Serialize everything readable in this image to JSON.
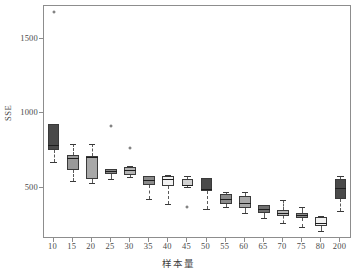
{
  "chart_data": {
    "type": "box",
    "title": "",
    "subtitle": "",
    "xlabel": "样本量",
    "ylabel": "SSE",
    "grid": false,
    "legend": "none",
    "ylim": [
      170,
      1720
    ],
    "y_ticks": [
      500,
      1000,
      1500
    ],
    "y_tick_labels": [
      "500",
      "1000",
      "1500"
    ],
    "categories": [
      "10",
      "15",
      "20",
      "25",
      "30",
      "35",
      "40",
      "45",
      "50",
      "55",
      "60",
      "65",
      "70",
      "75",
      "80",
      "200"
    ],
    "boxes": [
      {
        "category": "10",
        "min": 670,
        "q1": 752,
        "median": 790,
        "q3": 925,
        "max": 925,
        "fill": "#4a4a4a",
        "outliers": [
          1680
        ]
      },
      {
        "category": "15",
        "min": 548,
        "q1": 620,
        "median": 700,
        "q3": 720,
        "max": 795,
        "fill": "#9a9a9a",
        "outliers": []
      },
      {
        "category": "20",
        "min": 535,
        "q1": 557,
        "median": 705,
        "q3": 712,
        "max": 795,
        "fill": "#a8a8a8",
        "outliers": []
      },
      {
        "category": "25",
        "min": 562,
        "q1": 596,
        "median": 612,
        "q3": 625,
        "max": 628,
        "fill": "#888888",
        "outliers": [
          915
        ]
      },
      {
        "category": "30",
        "min": 572,
        "q1": 588,
        "median": 618,
        "q3": 640,
        "max": 648,
        "fill": "#b4b4b4",
        "outliers": [
          768
        ]
      },
      {
        "category": "35",
        "min": 428,
        "q1": 520,
        "median": 552,
        "q3": 578,
        "max": 582,
        "fill": "#8a8a8a",
        "outliers": []
      },
      {
        "category": "40",
        "min": 390,
        "q1": 510,
        "median": 562,
        "q3": 578,
        "max": 588,
        "fill": "#f2f2f2",
        "outliers": []
      },
      {
        "category": "45",
        "min": 505,
        "q1": 512,
        "median": 522,
        "q3": 560,
        "max": 578,
        "fill": "#d2d2d2",
        "outliers": [
          372
        ]
      },
      {
        "category": "50",
        "min": 358,
        "q1": 478,
        "median": 490,
        "q3": 568,
        "max": 568,
        "fill": "#4a4a4a",
        "outliers": []
      },
      {
        "category": "55",
        "min": 368,
        "q1": 390,
        "median": 428,
        "q3": 458,
        "max": 472,
        "fill": "#8a8a8a",
        "outliers": []
      },
      {
        "category": "60",
        "min": 330,
        "q1": 365,
        "median": 398,
        "q3": 445,
        "max": 475,
        "fill": "#a8a8a8",
        "outliers": []
      },
      {
        "category": "65",
        "min": 298,
        "q1": 328,
        "median": 355,
        "q3": 382,
        "max": 385,
        "fill": "#6f6f6f",
        "outliers": []
      },
      {
        "category": "70",
        "min": 262,
        "q1": 312,
        "median": 330,
        "q3": 352,
        "max": 418,
        "fill": "#b8b8b8",
        "outliers": []
      },
      {
        "category": "75",
        "min": 240,
        "q1": 300,
        "median": 318,
        "q3": 330,
        "max": 372,
        "fill": "#8a8a8a",
        "outliers": []
      },
      {
        "category": "80",
        "min": 208,
        "q1": 245,
        "median": 265,
        "q3": 305,
        "max": 312,
        "fill": "#f2f2f2",
        "outliers": []
      },
      {
        "category": "200",
        "min": 345,
        "q1": 422,
        "median": 500,
        "q3": 562,
        "max": 582,
        "fill": "#4a4a4a",
        "outliers": []
      }
    ]
  },
  "axes": {
    "y_title": "SSE",
    "x_title": "样本量"
  }
}
